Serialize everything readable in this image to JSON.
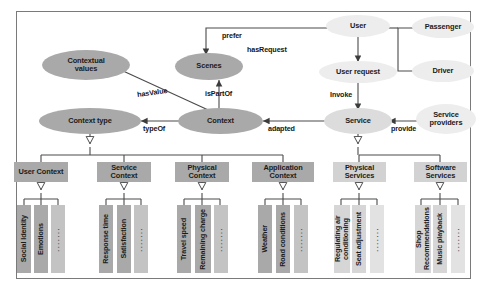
{
  "diagram": {
    "colors": {
      "oval_dark": "#a9a9a9",
      "oval_light": "#dcdcdc",
      "box_dark": "#a9a9a9",
      "box_light": "#d2d2d2",
      "line": "#4a4a4a",
      "frame": "#7a7a7a",
      "background": "#ffffff"
    },
    "ovals": [
      {
        "id": "contextual_values",
        "label": "Contextual\nvalues",
        "shade": "dark"
      },
      {
        "id": "scenes",
        "label": "Scenes",
        "shade": "dark"
      },
      {
        "id": "user",
        "label": "User",
        "shade": "light"
      },
      {
        "id": "passenger",
        "label": "Passenger",
        "shade": "light"
      },
      {
        "id": "driver",
        "label": "Driver",
        "shade": "light"
      },
      {
        "id": "user_request",
        "label": "User request",
        "shade": "light"
      },
      {
        "id": "context_type",
        "label": "Context type",
        "shade": "dark"
      },
      {
        "id": "context",
        "label": "Context",
        "shade": "dark"
      },
      {
        "id": "service",
        "label": "Service",
        "shade": "light"
      },
      {
        "id": "service_providers",
        "label": "Service\nproviders",
        "shade": "light"
      }
    ],
    "edge_labels": [
      {
        "id": "prefer",
        "text": "prefer"
      },
      {
        "id": "has_request",
        "text": "hasRequest"
      },
      {
        "id": "has_value",
        "text": "hasValue"
      },
      {
        "id": "is_part_of",
        "text": "isPartOf"
      },
      {
        "id": "invoke",
        "text": "Invoke"
      },
      {
        "id": "type_of",
        "text": "typeOf"
      },
      {
        "id": "adapted",
        "text": "adapted"
      },
      {
        "id": "provide",
        "text": "provide"
      }
    ],
    "categories": [
      {
        "id": "user_context",
        "label": "User Context",
        "shade": "dark",
        "children": [
          {
            "label": "Social Identity",
            "shade": "dark"
          },
          {
            "label": "Emotions",
            "shade": "dark"
          },
          {
            "label": "·······",
            "shade": "light",
            "is_dots": true
          }
        ]
      },
      {
        "id": "service_context",
        "label": "Service\nContext",
        "shade": "dark",
        "children": [
          {
            "label": "Response time",
            "shade": "dark"
          },
          {
            "label": "Satisfaction",
            "shade": "dark"
          },
          {
            "label": "·······",
            "shade": "light",
            "is_dots": true
          }
        ]
      },
      {
        "id": "physical_context",
        "label": "Physical\nContext",
        "shade": "dark",
        "children": [
          {
            "label": "Travel speed",
            "shade": "dark"
          },
          {
            "label": "Remaining charge",
            "shade": "dark"
          },
          {
            "label": "·······",
            "shade": "light",
            "is_dots": true
          }
        ]
      },
      {
        "id": "application_context",
        "label": "Application\nContext",
        "shade": "dark",
        "children": [
          {
            "label": "Weather",
            "shade": "dark"
          },
          {
            "label": "Road conditions",
            "shade": "dark"
          },
          {
            "label": "·······",
            "shade": "light",
            "is_dots": true
          }
        ]
      },
      {
        "id": "physical_services",
        "label": "Physical\nServices",
        "shade": "light",
        "children": [
          {
            "label": "Regulating air conditioning",
            "shade": "light"
          },
          {
            "label": "Seat adjustment",
            "shade": "light"
          },
          {
            "label": "·······",
            "shade": "xlight",
            "is_dots": true
          }
        ]
      },
      {
        "id": "software_services",
        "label": "Software\nServices",
        "shade": "light",
        "children": [
          {
            "label": "Shop Recommendations",
            "shade": "light"
          },
          {
            "label": "Music playback",
            "shade": "light"
          },
          {
            "label": "·······",
            "shade": "xlight",
            "is_dots": true
          }
        ]
      }
    ]
  }
}
